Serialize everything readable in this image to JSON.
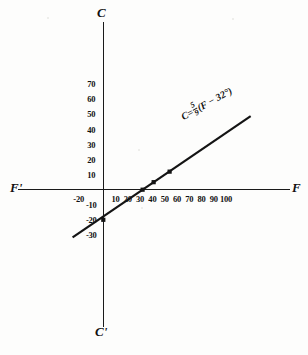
{
  "figure": {
    "title": "",
    "background_color": "#fdfdfc",
    "ink_color": "#1a1a1a"
  },
  "axes": {
    "x_positive_label": "F",
    "x_negative_label": "F'",
    "y_positive_label": "C",
    "y_negative_label": "C'"
  },
  "equation": {
    "lhs": "C",
    "equals": "=",
    "numerator": "5",
    "denominator": "9",
    "rhs": "(F − 32°)"
  },
  "chart_data": {
    "type": "line",
    "title": "",
    "xlabel": "F",
    "ylabel": "C",
    "grid": false,
    "legend": "none",
    "xlim": [
      -30,
      120
    ],
    "ylim": [
      -40,
      80
    ],
    "x_ticks": [
      -20,
      10,
      20,
      30,
      40,
      50,
      60,
      70,
      80,
      90,
      100
    ],
    "x_tick_labels": [
      "-20",
      "10",
      "20",
      "30",
      "40",
      "50",
      "60",
      "70",
      "80",
      "90",
      "100"
    ],
    "y_ticks": [
      -30,
      -20,
      -10,
      10,
      20,
      30,
      40,
      50,
      60,
      70
    ],
    "y_tick_labels": [
      "-30",
      "-20",
      "-10",
      "10",
      "20",
      "30",
      "40",
      "50",
      "60",
      "70"
    ],
    "series": [
      {
        "name": "C = 5/9 (F - 32)",
        "annotation": "C = 5/9 (F − 32°)",
        "x": [
          -25,
          120
        ],
        "y": [
          -31.7,
          48.9
        ],
        "slope": 0.5556,
        "intercept": -17.78,
        "line_color": "#141414",
        "line_width": 2.2
      }
    ],
    "markers": [
      {
        "label": "(0, -20)",
        "x": 0,
        "y": -20
      },
      {
        "label": "(32, 0)",
        "x": 32,
        "y": 0
      },
      {
        "label": "(41, 5)",
        "x": 41,
        "y": 5
      },
      {
        "label": "(54, 12)",
        "x": 54,
        "y": 12
      }
    ],
    "marker_style": "square",
    "marker_color": "#141414"
  }
}
